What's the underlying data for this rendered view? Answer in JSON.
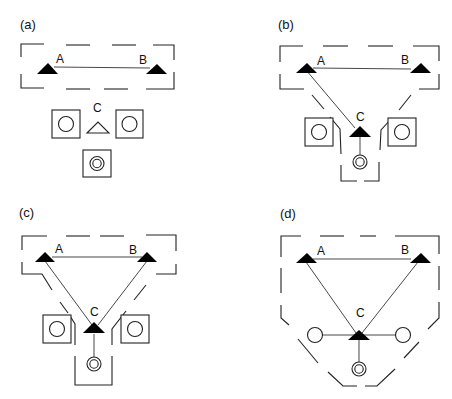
{
  "figure": {
    "panels": [
      {
        "id": "a",
        "label": "(a)",
        "nodes": {
          "A": "A",
          "B": "B",
          "C": "C"
        },
        "description": "A and B linked inside dashed enclosure; C (open triangle) separate with two square modules and one double-circle module"
      },
      {
        "id": "b",
        "label": "(b)",
        "nodes": {
          "A": "A",
          "B": "B",
          "C": "C"
        },
        "description": "A linked to B and C; enclosure extended via a channel to C and double-circle module"
      },
      {
        "id": "c",
        "label": "(c)",
        "nodes": {
          "A": "A",
          "B": "B",
          "C": "C"
        },
        "description": "A, B, C form triangle; dashed channels from both A and B to C; C linked to double-circle"
      },
      {
        "id": "d",
        "label": "(d)",
        "nodes": {
          "A": "A",
          "B": "B",
          "C": "C"
        },
        "description": "A, B, C fully linked in single enclosure; C linked to two circles and a double-circle"
      }
    ],
    "legend_symbols": {
      "filled_triangle": "active node",
      "open_triangle": "inactive node",
      "square_with_circle": "module",
      "double_circle": "core module",
      "dashed_outline": "boundary"
    },
    "colors": {
      "line": "#222222",
      "fill": "#000000",
      "background": "#ffffff"
    }
  }
}
